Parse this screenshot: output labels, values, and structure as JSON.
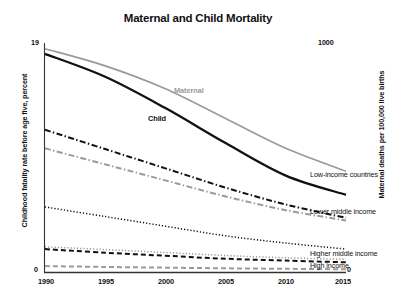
{
  "chart_data": {
    "type": "line",
    "title": "Maternal and Child Mortality",
    "xlabel": "",
    "ylabel": "Childhood fatality rate before age five, percent",
    "ylabel_right": "Maternal deaths per 100,000 live births",
    "grid": false,
    "legend_position": "right-inline",
    "x": [
      1990,
      1995,
      2000,
      2005,
      2010,
      2015
    ],
    "xlim": [
      1990,
      2015
    ],
    "ylim": [
      0,
      19
    ],
    "ylim_right": [
      0,
      1000
    ],
    "xtick_labels": [
      "1990",
      "1995",
      "2000",
      "2005",
      "2010",
      "2015"
    ],
    "ytick_labels_left": [
      "19",
      "0"
    ],
    "ytick_labels_right": [
      "1000",
      "0"
    ],
    "annotations": [
      {
        "text": "Maternal",
        "color": "#9a9a9a"
      },
      {
        "text": "Child",
        "color": "#111111"
      }
    ],
    "series": [
      {
        "name": "Low-income countries",
        "metric": "Maternal",
        "color": "#9a9a9a",
        "style": "solid",
        "axis": "right",
        "values": [
          975,
          900,
          800,
          670,
          540,
          440
        ]
      },
      {
        "name": "Low-income countries",
        "metric": "Child",
        "color": "#111111",
        "style": "solid",
        "axis": "left",
        "values": [
          18.1,
          16.2,
          13.6,
          10.7,
          8.0,
          6.4
        ]
      },
      {
        "name": "Lower middle income",
        "metric": "Child",
        "color": "#111111",
        "style": "dashdot",
        "axis": "left",
        "values": [
          11.8,
          10.2,
          8.6,
          7.0,
          5.6,
          4.5
        ]
      },
      {
        "name": "Lower middle income",
        "metric": "Maternal",
        "color": "#9a9a9a",
        "style": "dashdot",
        "axis": "right",
        "values": [
          540,
          470,
          400,
          330,
          270,
          225
        ]
      },
      {
        "name": "Higher middle income",
        "metric": "Child",
        "color": "#111111",
        "style": "dotted",
        "axis": "left",
        "values": [
          5.4,
          4.6,
          3.8,
          3.0,
          2.4,
          1.9
        ]
      },
      {
        "name": "Higher middle income",
        "metric": "Maternal",
        "color": "#9a9a9a",
        "style": "dotted",
        "axis": "right",
        "values": [
          110,
          98,
          85,
          72,
          62,
          55
        ]
      },
      {
        "name": "High income",
        "metric": "Child",
        "color": "#111111",
        "style": "dashed",
        "axis": "left",
        "values": [
          1.9,
          1.6,
          1.35,
          1.1,
          0.95,
          0.8
        ]
      },
      {
        "name": "High income",
        "metric": "Maternal",
        "color": "#9a9a9a",
        "style": "dashed",
        "axis": "right",
        "values": [
          26,
          22,
          19,
          16,
          14,
          12
        ]
      }
    ]
  },
  "labels": {
    "title": "Maternal and Child Mortality",
    "ylabel_left": "Childhood fatality rate before age five, percent",
    "ylabel_right": "Maternal deaths per 100,000 live births",
    "tick_left_top": "19",
    "tick_left_zero": "0",
    "tick_right_top": "1000",
    "tick_right_zero": "0",
    "inline_maternal": "Maternal",
    "inline_child": "Child",
    "series_low_income": "Low-income countries",
    "series_lower_middle": "Lower middle income",
    "series_higher_middle": "Higher middle income",
    "series_high_income": "High income"
  },
  "colors": {
    "child": "#111111",
    "maternal": "#9a9a9a",
    "axis": "#333333",
    "background": "#ffffff"
  }
}
